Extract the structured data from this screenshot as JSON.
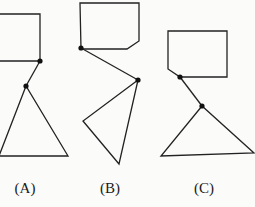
{
  "figures": [
    {
      "label": "(A)",
      "label_pos": [
        25,
        180
      ],
      "head": [
        [
          -2,
          14
        ],
        [
          40,
          14
        ],
        [
          40,
          61
        ],
        [
          -2,
          61
        ]
      ],
      "joints": [
        [
          40,
          61
        ],
        [
          26,
          86
        ]
      ],
      "body": [
        [
          26,
          86
        ],
        [
          -1,
          156
        ],
        [
          68,
          156
        ]
      ]
    },
    {
      "label": "(B)",
      "label_pos": [
        110,
        180
      ],
      "head": [
        [
          80,
          3
        ],
        [
          139,
          3
        ],
        [
          139,
          41
        ],
        [
          127,
          49
        ],
        [
          81,
          49
        ]
      ],
      "joints": [
        [
          81,
          48
        ],
        [
          138,
          80
        ]
      ],
      "body": [
        [
          138,
          80
        ],
        [
          83,
          121
        ],
        [
          119,
          164
        ]
      ]
    },
    {
      "label": "(C)",
      "label_pos": [
        204,
        180
      ],
      "head": [
        [
          168,
          31
        ],
        [
          227,
          31
        ],
        [
          227,
          77
        ],
        [
          180,
          77
        ],
        [
          168,
          69
        ]
      ],
      "joints": [
        [
          180,
          77
        ],
        [
          202,
          106
        ]
      ],
      "body": [
        [
          202,
          106
        ],
        [
          161,
          156
        ],
        [
          254,
          153
        ]
      ]
    }
  ],
  "colors": {
    "stroke": "#222222",
    "background": "#fbfbfa"
  }
}
